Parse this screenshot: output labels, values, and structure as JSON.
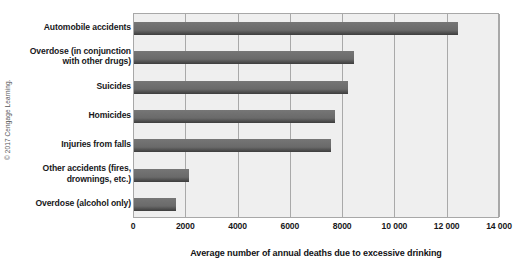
{
  "credit": "© 2017 Cengage Learning.",
  "chart_data": {
    "type": "bar",
    "orientation": "horizontal",
    "title": "",
    "xlabel": "Average number of annual deaths due to excessive drinking",
    "ylabel": "",
    "xlim": [
      0,
      14000
    ],
    "xtick_labels": [
      "0",
      "2000",
      "4000",
      "6000",
      "8000",
      "10 000",
      "12 000",
      "14 000"
    ],
    "xtick_values": [
      0,
      2000,
      4000,
      6000,
      8000,
      10000,
      12000,
      14000
    ],
    "grid": true,
    "legend": false,
    "bar_color": "#6a6a6a",
    "plot_background": "#efefef",
    "categories": [
      "Automobile accidents",
      "Overdose (in conjunction with other drugs)",
      "Suicides",
      "Homicides",
      "Injuries from falls",
      "Other accidents (fires, drownings, etc.)",
      "Overdose (alcohol only)"
    ],
    "category_lines": [
      [
        "Automobile accidents"
      ],
      [
        "Overdose (in conjunction",
        "with other drugs)"
      ],
      [
        "Suicides"
      ],
      [
        "Homicides"
      ],
      [
        "Injuries from falls"
      ],
      [
        "Other accidents (fires,",
        "drownings, etc.)"
      ],
      [
        "Overdose (alcohol only)"
      ]
    ],
    "values": [
      12400,
      8400,
      8200,
      7700,
      7550,
      2100,
      1600
    ]
  }
}
